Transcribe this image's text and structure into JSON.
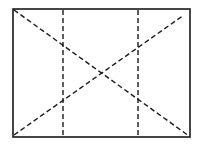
{
  "diagram": {
    "type": "line-sketch",
    "width": 198,
    "height": 144,
    "stroke_color": "#1a1a1a",
    "background": "#ffffff",
    "frame": {
      "x1": 13,
      "y1": 9,
      "x2": 190,
      "y2": 137,
      "style": "solid"
    },
    "lines": [
      {
        "id": "vertical-left",
        "x1": 63,
        "y1": 10,
        "x2": 63,
        "y2": 136,
        "style": "dashed"
      },
      {
        "id": "vertical-right",
        "x1": 138,
        "y1": 10,
        "x2": 138,
        "y2": 136,
        "style": "dashed"
      },
      {
        "id": "diagonal-down",
        "x1": 14,
        "y1": 10,
        "x2": 189,
        "y2": 136,
        "style": "dashed"
      },
      {
        "id": "diagonal-up",
        "x1": 14,
        "y1": 135,
        "x2": 184,
        "y2": 15,
        "style": "dashed"
      }
    ]
  }
}
